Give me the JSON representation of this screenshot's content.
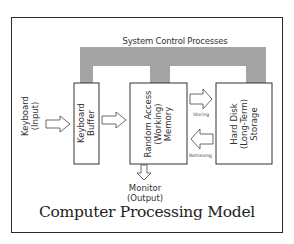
{
  "diagram": {
    "title": "Computer Processing Model",
    "control_bar_label": "System Control Processes",
    "nodes": {
      "keyboard_input": {
        "line1": "Keyboard",
        "line2": "(Input)"
      },
      "keyboard_buffer": {
        "line1": "Keyboard",
        "line2": "Buffer"
      },
      "ram": {
        "line1": "Random Access",
        "line2": "(Working)",
        "line3": "Memory"
      },
      "hard_disk": {
        "line1": "Hard Disk",
        "line2": "(Long-Term)",
        "line3": "Storage"
      },
      "monitor": {
        "line1": "Monitor",
        "line2": "(Output)"
      }
    },
    "edges": {
      "storing": "Storing",
      "retrieving": "Retrieving"
    },
    "colors": {
      "control_bar": "#a4a4a4",
      "border": "#2a2a2a"
    }
  }
}
